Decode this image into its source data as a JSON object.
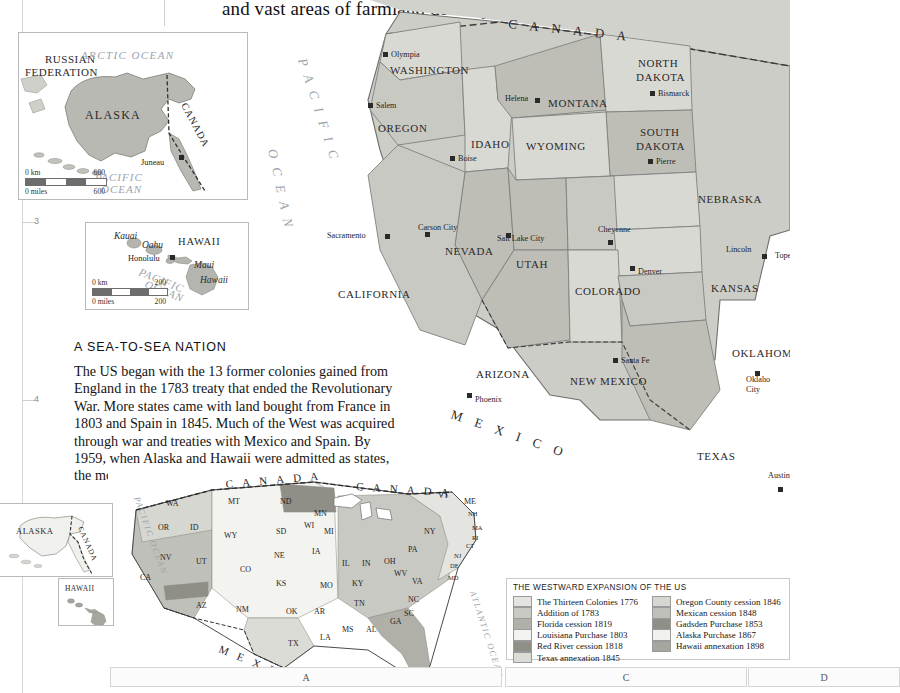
{
  "page": {
    "top_text": "and vast areas of farmland developed.",
    "caption_line1": "President's official residence,",
    "caption_line2_italic": "the White House",
    "caption_line2_rom": " (above).",
    "margin_numbers": [
      "3",
      "4"
    ],
    "bottom_grid_refs": [
      "A",
      "C",
      "D"
    ]
  },
  "article": {
    "heading": "A SEA-TO-SEA NATION",
    "body": "The US began with the 13 former colonies gained from England in the 1783 treaty that ended the Revolutionary War. More states came with land bought from France in 1803 and Spain in 1845. Much of the West was acquired through war and treaties with Mexico and Spain. By 1959, when Alaska and Hawaii were admitted as states, the modern shape of the Union was complete."
  },
  "colors": {
    "land_light": "#d6d6d2",
    "land_mid": "#c3c3bd",
    "land_dark": "#a9a9a3",
    "land_darkest": "#8e8e88",
    "land_pale": "#eaeae6",
    "ocean": "#ffffff",
    "border": "#6f6f6f",
    "ocean_text": "#9aa3ab"
  },
  "alaska_inset": {
    "name": "alaska-inset",
    "labels": [
      {
        "text": "RUSSIAN",
        "kind": "country"
      },
      {
        "text": "FEDERATION",
        "kind": "country"
      },
      {
        "text": "ARCTIC OCEAN",
        "kind": "ocean"
      },
      {
        "text": "ALASKA",
        "kind": "state"
      },
      {
        "text": "CANADA",
        "kind": "country"
      },
      {
        "text": "Juneau",
        "kind": "capital"
      },
      {
        "text": "PACIFIC",
        "kind": "ocean"
      },
      {
        "text": "OCEAN",
        "kind": "ocean"
      }
    ],
    "scale": {
      "km_label": "0 km",
      "km_value": "600",
      "miles_label": "0 miles",
      "miles_value": "600"
    }
  },
  "hawaii_inset": {
    "name": "hawaii-inset",
    "labels": [
      {
        "text": "Kauai",
        "kind": "island"
      },
      {
        "text": "Oahu",
        "kind": "island"
      },
      {
        "text": "HAWAII",
        "kind": "state"
      },
      {
        "text": "Honolulu",
        "kind": "capital"
      },
      {
        "text": "Maui",
        "kind": "island"
      },
      {
        "text": "Hawaii",
        "kind": "island"
      },
      {
        "text": "PACIFIC",
        "kind": "ocean"
      },
      {
        "text": "OCEAN",
        "kind": "ocean"
      }
    ],
    "scale": {
      "km_label": "0 km",
      "km_value": "200",
      "miles_label": "0 miles",
      "miles_value": "200"
    }
  },
  "main_map": {
    "name": "western-united-states-map",
    "ocean_label": "PACIFIC OCEAN",
    "countries": [
      "CANADA",
      "MEXICO"
    ],
    "states": [
      {
        "name": "WASHINGTON",
        "capital": "Olympia"
      },
      {
        "name": "OREGON",
        "capital": "Salem"
      },
      {
        "name": "IDAHO",
        "capital": "Boise"
      },
      {
        "name": "MONTANA",
        "capital": "Helena"
      },
      {
        "name": "NORTH DAKOTA",
        "capital": "Bismarck"
      },
      {
        "name": "SOUTH DAKOTA",
        "capital": "Pierre"
      },
      {
        "name": "WYOMING",
        "capital": "Cheyenne"
      },
      {
        "name": "NEBRASKA",
        "capital": "Lincoln"
      },
      {
        "name": "CALIFORNIA",
        "capital": "Sacramento"
      },
      {
        "name": "NEVADA",
        "capital": "Carson City"
      },
      {
        "name": "UTAH",
        "capital": "Salt Lake City"
      },
      {
        "name": "COLORADO",
        "capital": "Denver"
      },
      {
        "name": "KANSAS",
        "capital": "Topeka"
      },
      {
        "name": "ARIZONA",
        "capital": "Phoenix"
      },
      {
        "name": "NEW MEXICO",
        "capital": "Santa Fe"
      },
      {
        "name": "OKLAHOMA",
        "capital": "Oklahoma City"
      },
      {
        "name": "TEXAS",
        "capital": "Austin"
      }
    ]
  },
  "thematic_map": {
    "name": "westward-expansion-map",
    "countries": [
      "CANADA",
      "MEXICO"
    ],
    "oceans": [
      "PACIFIC OCEAN",
      "ATLANTIC OCEAN",
      "Gulf of Mexico"
    ],
    "inset_labels": [
      "ALASKA",
      "CANADA",
      "HAWAII"
    ],
    "state_abbreviations": [
      "WA",
      "OR",
      "ID",
      "MT",
      "ND",
      "MN",
      "SD",
      "WY",
      "NV",
      "UT",
      "CO",
      "NE",
      "IA",
      "CA",
      "AZ",
      "NM",
      "KS",
      "OK",
      "TX",
      "MO",
      "AR",
      "LA",
      "MS",
      "AL",
      "GA",
      "FL",
      "TN",
      "KY",
      "IL",
      "IN",
      "OH",
      "MI",
      "WI",
      "WV",
      "VA",
      "NC",
      "SC",
      "PA",
      "NY",
      "ME",
      "VT",
      "NH",
      "MA",
      "RI",
      "CT",
      "NJ",
      "DE",
      "MD"
    ]
  },
  "legend": {
    "title": "THE WESTWARD EXPANSION OF THE US",
    "column_left": [
      {
        "label": "The Thirteen Colonies 1776",
        "color": "#e4e4e0"
      },
      {
        "label": "Addition of 1783",
        "color": "#c9c9c3"
      },
      {
        "label": "Florida cession 1819",
        "color": "#b0b0a9"
      },
      {
        "label": "Louisiana Purchase 1803",
        "color": "#f3f3f0"
      },
      {
        "label": "Red River cession 1818",
        "color": "#8f8f88"
      },
      {
        "label": "Texas annexation 1845",
        "color": "#dcdcd7"
      }
    ],
    "column_right": [
      {
        "label": "Oregon County cession 1846",
        "color": "#d7d7d2"
      },
      {
        "label": "Mexican cession 1848",
        "color": "#c0c0ba"
      },
      {
        "label": "Gadsden Purchase 1853",
        "color": "#8f8f88"
      },
      {
        "label": "Alaska Purchase 1867",
        "color": "#f0f0ed"
      },
      {
        "label": "Hawaii annexation 1898",
        "color": "#a6a69f"
      }
    ]
  }
}
